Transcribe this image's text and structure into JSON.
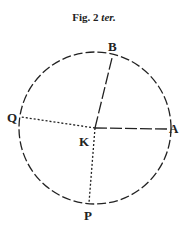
{
  "figure": {
    "title_prefix": "Fig. 2",
    "title_suffix": "ter.",
    "labels": {
      "B": "B",
      "A": "A",
      "Q": "Q",
      "K": "K",
      "P": "P"
    }
  }
}
